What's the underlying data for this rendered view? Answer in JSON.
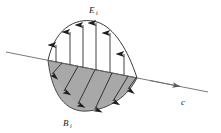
{
  "figure": {
    "background_color": "#ffffff",
    "stroke_color": "#2b2b2b",
    "fill_color": "#a8a8a8",
    "labels": {
      "e_field": {
        "symbol": "E",
        "subscript": "i",
        "x": 92,
        "y": 12
      },
      "b_field": {
        "symbol": "B",
        "subscript": "i",
        "x": 66,
        "y": 125
      },
      "propagation": {
        "symbol": "c",
        "subscript": "",
        "x": 183,
        "y": 104
      }
    },
    "axis": {
      "name": "propagation-axis",
      "x1": 6,
      "y1": 52,
      "x2": 208,
      "y2": 92,
      "arrow_at": "end",
      "arrow_x": 178,
      "arrow_y": 84.7
    },
    "wave": {
      "crossing_left_x": 48,
      "crossing_left_y": 60.3,
      "crossing_right_x": 137,
      "crossing_right_y": 77.9,
      "peak_x": 95,
      "peak_y": 22,
      "trough_x": 92,
      "trough_y": 110
    },
    "e_arrows": [
      {
        "x": 56,
        "y_base": 61.9,
        "y_tip": 45
      },
      {
        "x": 70,
        "y_base": 64.7,
        "y_tip": 32
      },
      {
        "x": 83,
        "y_base": 67.3,
        "y_tip": 25
      },
      {
        "x": 96,
        "y_base": 69.9,
        "y_tip": 23
      },
      {
        "x": 110,
        "y_base": 72.6,
        "y_tip": 33
      },
      {
        "x": 124,
        "y_base": 75.4,
        "y_tip": 54
      }
    ],
    "b_arrows": [
      {
        "x_base": 62,
        "y_base": 63.1,
        "x_tip": 52,
        "y_tip": 74
      },
      {
        "x_base": 78,
        "y_base": 66.3,
        "x_tip": 64,
        "y_tip": 91
      },
      {
        "x_base": 95,
        "y_base": 69.7,
        "x_tip": 78,
        "y_tip": 104
      },
      {
        "x_base": 112,
        "y_base": 73.0,
        "x_tip": 95,
        "y_tip": 109
      },
      {
        "x_base": 128,
        "y_base": 76.2,
        "x_tip": 113,
        "y_tip": 101
      },
      {
        "x_base": 136,
        "y_base": 77.8,
        "x_tip": 128,
        "y_tip": 89
      }
    ]
  }
}
